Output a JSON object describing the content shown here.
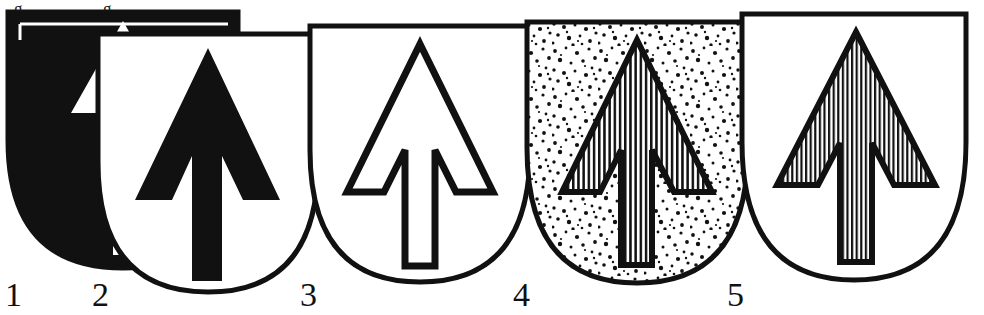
{
  "plate": {
    "title": "Heraldic shields plate",
    "description": "Five overlapping heraldic shields, each charged with an arrow (pheon) drawn in a different heraldic tincture convention.",
    "background_color": "#ffffff",
    "ink_color": "#111111",
    "width": 984,
    "height": 315
  },
  "cropped_text_top": [
    {
      "id": "crop-mark-1",
      "glyph": "g"
    },
    {
      "id": "crop-mark-2",
      "glyph": "g"
    },
    {
      "id": "crop-mark-3",
      "glyph": ","
    }
  ],
  "figures": [
    {
      "number": "1",
      "label_x": 5,
      "label_y": 278,
      "field": "solid-black",
      "field_color": "#111111",
      "charge": "arrow",
      "charge_color": "#ffffff",
      "note": "Sable field with argent arrow; shield partly hidden behind figure 2"
    },
    {
      "number": "2",
      "label_x": 92,
      "label_y": 278,
      "field": "white",
      "field_color": "#ffffff",
      "charge": "arrow",
      "charge_color": "#111111",
      "note": "Argent field with sable arrow"
    },
    {
      "number": "3",
      "label_x": 300,
      "label_y": 278,
      "field": "white",
      "field_color": "#ffffff",
      "charge": "arrow",
      "charge_color": "#ffffff",
      "note": "Argent field with arrow drawn in outline only"
    },
    {
      "number": "4",
      "label_x": 513,
      "label_y": 278,
      "field": "stippled",
      "field_color": "#ffffff",
      "charge": "arrow",
      "charge_color": "#ffffff",
      "note": "Stippled (or) field with vertically hatched (gules) arrow"
    },
    {
      "number": "5",
      "label_x": 727,
      "label_y": 278,
      "field": "white",
      "field_color": "#ffffff",
      "charge": "arrow",
      "charge_color": "#ffffff",
      "note": "Argent field with vertically hatched (gules) arrow"
    }
  ]
}
